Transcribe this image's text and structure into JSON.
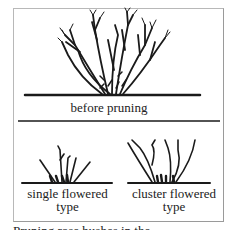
{
  "figure": {
    "top_panel": {
      "caption": "before pruning"
    },
    "bottom_panel": {
      "left": {
        "caption_line1": "single flowered",
        "caption_line2": "type"
      },
      "right": {
        "caption_line1": "cluster flowered",
        "caption_line2": "type"
      }
    }
  },
  "page": {
    "clipped_line": "Pruning rose bushes in the"
  },
  "colors": {
    "ink": "#1a1a1a",
    "frame": "#b0b0b0",
    "background": "#ffffff"
  }
}
